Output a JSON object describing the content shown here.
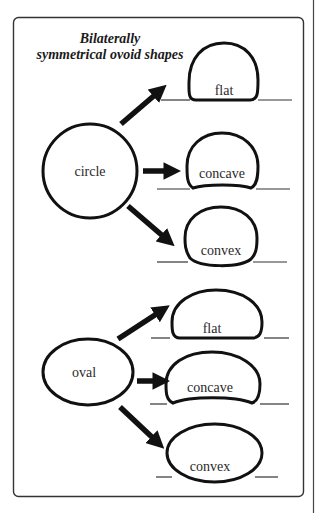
{
  "title": {
    "line1": "Bilaterally",
    "line2": "symmetrical ovoid shapes"
  },
  "sources": [
    {
      "id": "circle",
      "label": "circle"
    },
    {
      "id": "oval",
      "label": "oval"
    }
  ],
  "circle_group": {
    "source_label": "circle",
    "variants": [
      {
        "label": "flat"
      },
      {
        "label": "concave"
      },
      {
        "label": "convex"
      }
    ]
  },
  "oval_group": {
    "source_label": "oval",
    "variants": [
      {
        "label": "flat"
      },
      {
        "label": "concave"
      },
      {
        "label": "convex"
      }
    ]
  },
  "colors": {
    "stroke": "#111111",
    "frame": "#333333",
    "background": "#ffffff"
  }
}
